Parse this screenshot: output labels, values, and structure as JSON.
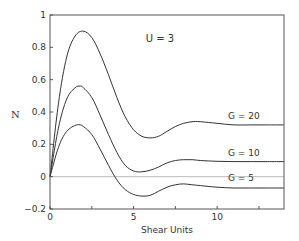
{
  "chart_data": {
    "type": "line",
    "title": "",
    "annotation": "U = 3",
    "xlabel": "Shear Units",
    "ylabel": "N",
    "xlim": [
      0,
      14
    ],
    "ylim": [
      -0.2,
      1
    ],
    "x_ticks": [
      0,
      2.5,
      5,
      7.5,
      10,
      12.5
    ],
    "x_tick_labels": [
      "0",
      "",
      "5",
      "",
      "10",
      ""
    ],
    "y_ticks": [
      -0.2,
      0,
      0.2,
      0.4,
      0.6,
      0.8,
      1
    ],
    "y_tick_labels": [
      "-0.2",
      "0",
      "0.2",
      "0.4",
      "0.6",
      "0.8",
      "1"
    ],
    "grid": false,
    "zero_line": true,
    "legend": "inline labels",
    "series": [
      {
        "name": "G = 20",
        "x": [
          0,
          0.5,
          1.0,
          1.5,
          2.0,
          2.5,
          3.0,
          3.5,
          4.0,
          4.5,
          5.0,
          5.5,
          6.0,
          6.5,
          7.0,
          7.5,
          8.0,
          8.5,
          9.0,
          10.0,
          11.0,
          12.0,
          13.0,
          14.0
        ],
        "values": [
          0,
          0.45,
          0.74,
          0.87,
          0.9,
          0.86,
          0.76,
          0.63,
          0.49,
          0.37,
          0.29,
          0.25,
          0.24,
          0.25,
          0.28,
          0.31,
          0.33,
          0.34,
          0.34,
          0.33,
          0.32,
          0.32,
          0.32,
          0.32
        ]
      },
      {
        "name": "G = 10",
        "x": [
          0,
          0.5,
          1.0,
          1.5,
          1.8,
          2.0,
          2.5,
          3.0,
          3.5,
          4.0,
          4.5,
          5.0,
          5.5,
          6.0,
          6.5,
          7.0,
          7.5,
          8.0,
          8.5,
          9.0,
          10.0,
          11.0,
          12.0,
          13.0,
          14.0
        ],
        "values": [
          0,
          0.3,
          0.48,
          0.55,
          0.56,
          0.55,
          0.49,
          0.38,
          0.26,
          0.15,
          0.07,
          0.035,
          0.03,
          0.04,
          0.06,
          0.085,
          0.1,
          0.105,
          0.105,
          0.1,
          0.095,
          0.093,
          0.093,
          0.093,
          0.093
        ]
      },
      {
        "name": "G = 5",
        "x": [
          0,
          0.5,
          1.0,
          1.6,
          2.0,
          2.5,
          3.0,
          3.5,
          4.0,
          4.5,
          5.0,
          5.5,
          6.0,
          6.5,
          7.0,
          7.5,
          8.0,
          8.5,
          9.0,
          10.0,
          11.0,
          12.0,
          13.0,
          14.0
        ],
        "values": [
          0,
          0.18,
          0.28,
          0.32,
          0.31,
          0.26,
          0.17,
          0.07,
          -0.02,
          -0.08,
          -0.11,
          -0.12,
          -0.115,
          -0.09,
          -0.065,
          -0.05,
          -0.045,
          -0.05,
          -0.055,
          -0.065,
          -0.07,
          -0.07,
          -0.07,
          -0.07
        ]
      }
    ]
  }
}
